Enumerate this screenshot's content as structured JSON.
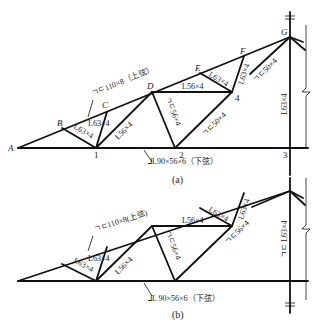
{
  "figure_a": {
    "caption": "(a)",
    "nodes": {
      "A": "A",
      "B": "B",
      "C": "C",
      "D": "D",
      "E": "E",
      "F": "F",
      "G": "G",
      "n1": "1",
      "n2": "2",
      "n3": "3",
      "n4": "4"
    },
    "labels": {
      "top_chord": "ㄱㄷ110×8（上弦）",
      "bottom_chord": "⅃L90×56×6（下弦）",
      "B1": "L63×4",
      "C1": "L63×4",
      "D1": "L56×4",
      "D2": "ㄱㄷ56×4",
      "D4": "L56×4",
      "E4": "L63×4",
      "F4": "L63×4",
      "G4": "ㄱㄷ50×4",
      "n2_4": "ㄱㄷ50×4",
      "G3": "L63×4"
    }
  },
  "figure_b": {
    "caption": "(b)",
    "labels": {
      "top_chord": "ㄱㄷ110×8(上弦)",
      "bottom_chord": "⅃L 90×56×6（下弦）",
      "B1": "L63×4",
      "C1": "L63×4",
      "D1": "L56×4",
      "D2": "ㄱㄷ56×4",
      "D4": "L56×4",
      "E4": "L63×4",
      "F4": "L63×4",
      "n2_4": "ㄱㄷ56×4",
      "G3": "ㄱㄷ L63×4"
    }
  }
}
